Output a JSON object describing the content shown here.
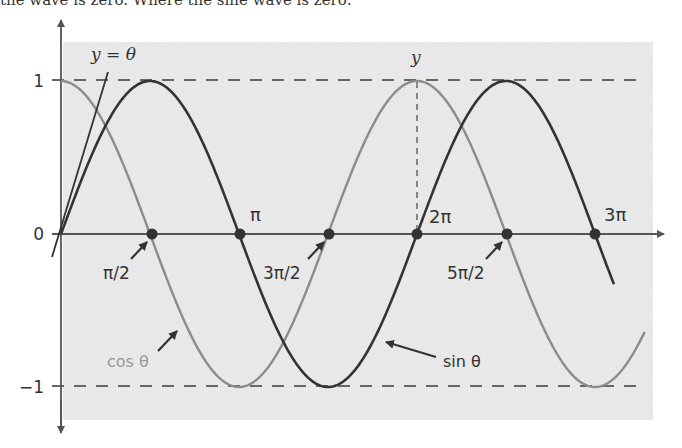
{
  "caption": "the wave is zero. Where the sine wave is zero:",
  "diagram": {
    "y_labels": {
      "one": "1",
      "zero": "0",
      "neg_one": "−1"
    },
    "line_label": "y = θ",
    "y_marker_label": "y",
    "x_labels": {
      "pi": "π",
      "two_pi": "2π",
      "three_pi": "3π",
      "pi_over_2": "π/2",
      "three_pi_over_2": "3π/2",
      "five_pi_over_2": "5π/2"
    },
    "curve_labels": {
      "cos": "cos θ",
      "sin": "sin θ"
    },
    "colors": {
      "sin": "#333333",
      "cos": "#8c8c8c",
      "axis": "#555555",
      "background": "#ebebeb",
      "dashed": "#666666"
    }
  },
  "chart_data": {
    "type": "line",
    "title": "",
    "xlabel": "θ",
    "ylabel": "y",
    "ylim": [
      -1,
      1
    ],
    "xlim": [
      0,
      9.78
    ],
    "x_ticks": [
      "π/2",
      "π",
      "3π/2",
      "2π",
      "5π/2",
      "3π"
    ],
    "y_ticks": [
      "-1",
      "0",
      "1"
    ],
    "grid": false,
    "series": [
      {
        "name": "sin θ",
        "function": "sin",
        "x": [
          0,
          1.571,
          3.142,
          4.712,
          6.283,
          7.854,
          9.425,
          9.77
        ],
        "values": [
          0,
          1,
          0,
          -1,
          0,
          1,
          0,
          -0.34
        ]
      },
      {
        "name": "cos θ",
        "function": "cos",
        "x": [
          0,
          1.571,
          3.142,
          4.712,
          6.283,
          7.854,
          9.425,
          10.3
        ],
        "values": [
          1,
          0,
          -1,
          0,
          1,
          0,
          -1,
          -0.65
        ]
      },
      {
        "name": "y = θ",
        "function": "linear",
        "x": [
          -0.16,
          0.82
        ],
        "values": [
          -0.16,
          0.82
        ]
      }
    ],
    "annotations": [
      "zeros of cos at π/2, 3π/2, 5π/2",
      "zeros of sin at 0, π, 2π, 3π",
      "dashed lines at y=1 and y=-1",
      "dashed vertical at θ=2π labeled y"
    ]
  }
}
